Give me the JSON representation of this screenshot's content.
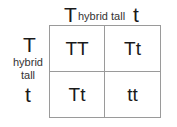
{
  "top_header": {
    "allele_left": "T",
    "label": "hybrid tall",
    "allele_right": "t"
  },
  "side_header": {
    "allele_top": "T",
    "label_line1": "hybrid",
    "label_line2": "tall",
    "allele_bottom": "t"
  },
  "cells": [
    [
      "TT",
      "Tt"
    ],
    [
      "Tt",
      "tt"
    ]
  ],
  "colors": {
    "grid_line": "#9a9a9a",
    "text": "#1a1a1a"
  }
}
